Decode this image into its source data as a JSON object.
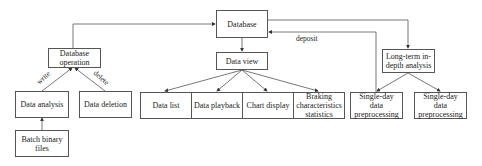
{
  "nodes": {
    "database": "Database",
    "database_operation": "Database operation",
    "data_analysis": "Data analysis",
    "data_deletion": "Data deletion",
    "batch_binary_files": "Batch binary files",
    "data_view": "Data view",
    "data_list": "Data list",
    "data_playback": "Data playback",
    "chart_display": "Chart display",
    "braking_statistics": "Braking characteristics statistics",
    "long_term_analysis": "Long-term in-depth analysis",
    "single_day_1": "Single-day data preprocessing",
    "single_day_2": "Single-day data preprocessing"
  },
  "edge_labels": {
    "write": "write",
    "delete": "delete",
    "deposit": "deposit"
  },
  "colors": {
    "line": "#555555",
    "border": "#555555"
  }
}
